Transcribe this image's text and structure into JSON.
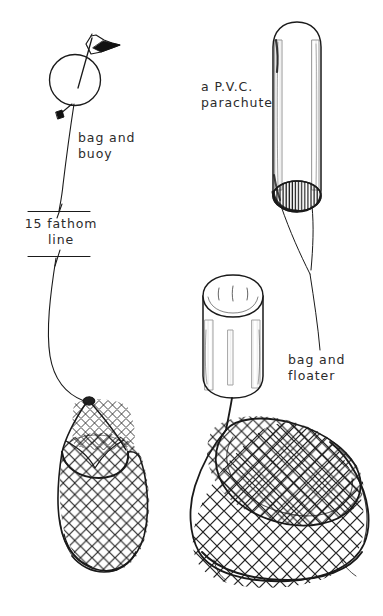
{
  "figure": {
    "background_color": "#ffffff",
    "ink_color": "#1a1a1a",
    "width": 383,
    "height": 616
  },
  "labels": {
    "bag_and_buoy": "bag and\nbuoy",
    "fathom_line": "15 fathom\nline",
    "pvc_parachute": "a P.V.C.\nparachute",
    "bag_and_floater": "bag and\nfloater"
  },
  "components": {
    "buoy": "spherical float with flag",
    "flag": "triangular pennant flag",
    "weight": "small dark weight",
    "buoy_line": "vertical rope line",
    "break_marks": "two horizontal line-break marks",
    "net_bag_left": "mesh net bag with gathered loop top",
    "pvc_parachute_cylinder": "open-ended PVC tube with hatched lower mouth",
    "parachute_bridle": "twin bridle lines from parachute mouth",
    "floater_cylinder": "open-topped cylindrical floater",
    "net_bag_right": "mesh net bag with hooped open mouth"
  }
}
